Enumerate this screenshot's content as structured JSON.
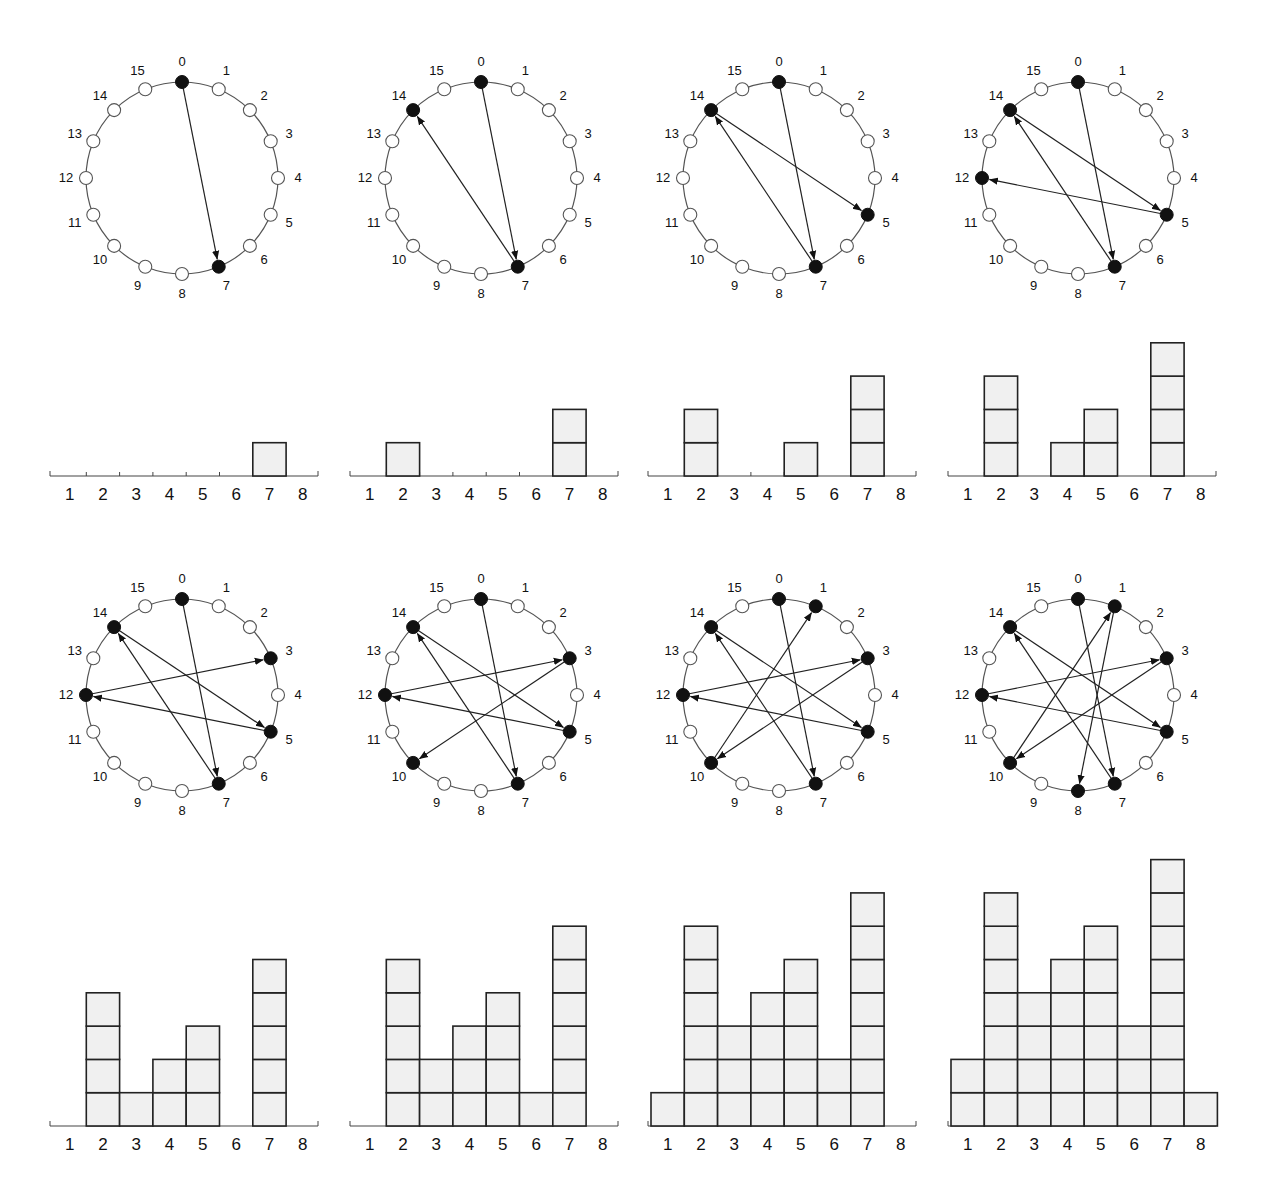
{
  "figure": {
    "node_labels": [
      "0",
      "1",
      "2",
      "3",
      "4",
      "5",
      "6",
      "7",
      "8",
      "9",
      "10",
      "11",
      "12",
      "13",
      "14",
      "15"
    ],
    "bin_labels": [
      "1",
      "2",
      "3",
      "4",
      "5",
      "6",
      "7",
      "8"
    ]
  },
  "chart_data": [
    {
      "type": "bar",
      "panel": 1,
      "title": "",
      "active_nodes": [
        0,
        7
      ],
      "edges": [
        [
          0,
          7
        ]
      ],
      "categories": [
        "1",
        "2",
        "3",
        "4",
        "5",
        "6",
        "7",
        "8"
      ],
      "values": [
        0,
        0,
        0,
        0,
        0,
        0,
        1,
        0
      ],
      "xlabel": "",
      "ylabel": "",
      "grid": false
    },
    {
      "type": "bar",
      "panel": 2,
      "active_nodes": [
        0,
        7,
        14
      ],
      "edges": [
        [
          0,
          7
        ],
        [
          7,
          14
        ]
      ],
      "categories": [
        "1",
        "2",
        "3",
        "4",
        "5",
        "6",
        "7",
        "8"
      ],
      "values": [
        0,
        1,
        0,
        0,
        0,
        0,
        2,
        0
      ]
    },
    {
      "type": "bar",
      "panel": 3,
      "active_nodes": [
        0,
        7,
        14,
        5
      ],
      "edges": [
        [
          0,
          7
        ],
        [
          7,
          14
        ],
        [
          14,
          5
        ]
      ],
      "categories": [
        "1",
        "2",
        "3",
        "4",
        "5",
        "6",
        "7",
        "8"
      ],
      "values": [
        0,
        2,
        0,
        0,
        1,
        0,
        3,
        0
      ]
    },
    {
      "type": "bar",
      "panel": 4,
      "active_nodes": [
        0,
        7,
        14,
        5,
        12
      ],
      "edges": [
        [
          0,
          7
        ],
        [
          7,
          14
        ],
        [
          14,
          5
        ],
        [
          5,
          12
        ]
      ],
      "categories": [
        "1",
        "2",
        "3",
        "4",
        "5",
        "6",
        "7",
        "8"
      ],
      "values": [
        0,
        3,
        0,
        1,
        2,
        0,
        4,
        0
      ]
    },
    {
      "type": "bar",
      "panel": 5,
      "active_nodes": [
        0,
        7,
        14,
        5,
        12,
        3
      ],
      "edges": [
        [
          0,
          7
        ],
        [
          7,
          14
        ],
        [
          14,
          5
        ],
        [
          5,
          12
        ],
        [
          12,
          3
        ]
      ],
      "categories": [
        "1",
        "2",
        "3",
        "4",
        "5",
        "6",
        "7",
        "8"
      ],
      "values": [
        0,
        4,
        1,
        2,
        3,
        0,
        5,
        0
      ]
    },
    {
      "type": "bar",
      "panel": 6,
      "active_nodes": [
        0,
        7,
        14,
        5,
        12,
        3,
        10
      ],
      "edges": [
        [
          0,
          7
        ],
        [
          7,
          14
        ],
        [
          14,
          5
        ],
        [
          5,
          12
        ],
        [
          12,
          3
        ],
        [
          3,
          10
        ]
      ],
      "categories": [
        "1",
        "2",
        "3",
        "4",
        "5",
        "6",
        "7",
        "8"
      ],
      "values": [
        0,
        5,
        2,
        3,
        4,
        1,
        6,
        0
      ]
    },
    {
      "type": "bar",
      "panel": 7,
      "active_nodes": [
        0,
        7,
        14,
        5,
        12,
        3,
        10,
        1
      ],
      "edges": [
        [
          0,
          7
        ],
        [
          7,
          14
        ],
        [
          14,
          5
        ],
        [
          5,
          12
        ],
        [
          12,
          3
        ],
        [
          3,
          10
        ],
        [
          10,
          1
        ]
      ],
      "categories": [
        "1",
        "2",
        "3",
        "4",
        "5",
        "6",
        "7",
        "8"
      ],
      "values": [
        1,
        6,
        3,
        4,
        5,
        2,
        7,
        0
      ]
    },
    {
      "type": "bar",
      "panel": 8,
      "active_nodes": [
        0,
        7,
        14,
        5,
        12,
        3,
        10,
        1,
        8
      ],
      "edges": [
        [
          0,
          7
        ],
        [
          7,
          14
        ],
        [
          14,
          5
        ],
        [
          5,
          12
        ],
        [
          12,
          3
        ],
        [
          3,
          10
        ],
        [
          10,
          1
        ],
        [
          1,
          8
        ]
      ],
      "categories": [
        "1",
        "2",
        "3",
        "4",
        "5",
        "6",
        "7",
        "8"
      ],
      "values": [
        2,
        7,
        4,
        5,
        6,
        3,
        8,
        1
      ]
    }
  ]
}
